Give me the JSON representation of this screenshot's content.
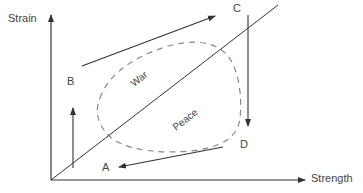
{
  "axes": {
    "y_label": "Strain",
    "x_label": "Strength"
  },
  "points": {
    "A": "A",
    "B": "B",
    "C": "C",
    "D": "D"
  },
  "regions": {
    "war": "War",
    "peace": "Peace"
  },
  "colors": {
    "line": "#333333",
    "dashed": "#888888",
    "text": "#444444"
  }
}
